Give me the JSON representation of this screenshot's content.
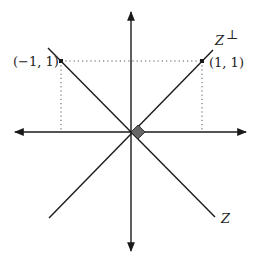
{
  "diagram": {
    "labels": {
      "point_left": "(−1, 1)",
      "point_right": "(1, 1)",
      "line_perp": "Z",
      "line_perp_sup": "⊥",
      "line_z": "Z"
    },
    "colors": {
      "line": "#1a1a1a",
      "dotted": "#555555",
      "marker_fill": "#666666"
    },
    "elements": [
      "horizontal-axis",
      "vertical-axis",
      "line-Z",
      "line-Z-perp",
      "projection-dotted-lines",
      "right-angle-marker"
    ]
  }
}
